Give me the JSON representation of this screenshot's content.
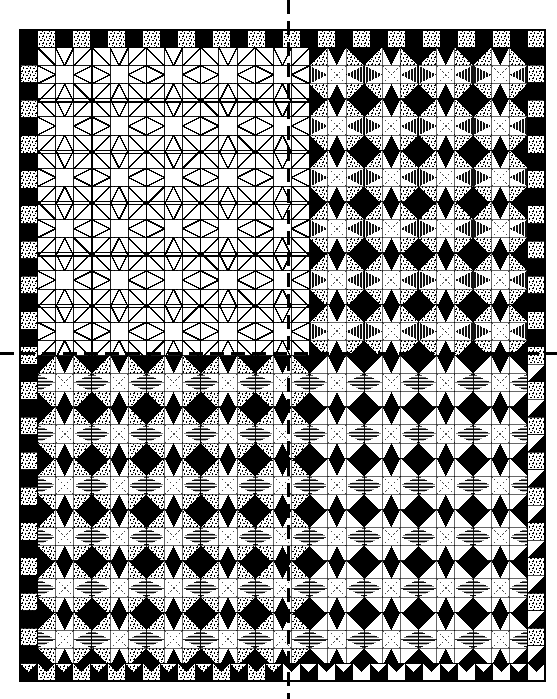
{
  "document": {
    "type": "quilt-pattern-diagram",
    "title": "Quilt Block Layout Diagram",
    "description": "Four-quadrant quilt design chart. Upper-left quadrant is an un-shaded line drawing of the pieced blocks; the other three quadrants show the same blocks filled with three fabric values (dark solid, dotted light, and line-shaded medium). Dashed center lines mark the vertical and horizontal axes of symmetry."
  },
  "canvas": {
    "width": 557,
    "height": 699,
    "background": "#ffffff"
  },
  "quilt": {
    "left": 20,
    "top": 30,
    "right": 545,
    "bottom": 681,
    "outline_color": "#000000",
    "outline_width": 2,
    "border_band_cells": 1,
    "cell_size": 17.5,
    "grid_cols": 30,
    "grid_rows": 37,
    "block_cells": 3,
    "block_cols": 10,
    "block_rows": 12
  },
  "center_lines": {
    "vertical_x": 288,
    "horizontal_y": 353,
    "style": "dashed",
    "color": "#000000",
    "width": 3,
    "dash": "14 7"
  },
  "fabrics": [
    {
      "key": "white",
      "label": "Background / white",
      "color": "#ffffff",
      "fill_type": "solid"
    },
    {
      "key": "dark",
      "label": "Dark solid fabric",
      "color": "#000000",
      "fill_type": "solid"
    },
    {
      "key": "dotted",
      "label": "Light dotted print fabric",
      "color": "#ffffff",
      "fill_type": "stipple"
    },
    {
      "key": "shaded",
      "label": "Medium line-shaded fabric",
      "color": "#ffffff",
      "fill_type": "hatch"
    },
    {
      "key": "outline",
      "label": "Piecing seam line",
      "color": "#000000",
      "fill_type": "line"
    }
  ],
  "quadrants": [
    {
      "key": "top-left",
      "name": "Unshaded line-drawing quadrant",
      "render_mode": "outline",
      "x": 20,
      "y": 30,
      "w": 268,
      "h": 323,
      "note": "Seam lines only, no fabric values"
    },
    {
      "key": "top-right",
      "name": "Shaded quadrant — star variant A",
      "render_mode": "filled",
      "x": 288,
      "y": 30,
      "w": 257,
      "h": 323,
      "note": "Blocks filled with dark, dotted and line-shaded fabrics"
    },
    {
      "key": "bottom-left",
      "name": "Shaded quadrant — star variant B",
      "render_mode": "filled",
      "x": 20,
      "y": 353,
      "w": 268,
      "h": 328,
      "note": "Heavier dark value placement, horizontal line shading"
    },
    {
      "key": "bottom-right",
      "name": "Shaded quadrant — star variant C",
      "render_mode": "filled",
      "x": 288,
      "y": 353,
      "w": 257,
      "h": 328,
      "note": "Dark outer border with sawtooth edge triangles"
    }
  ],
  "border": {
    "name": "Pieced checkerboard border",
    "pattern": "alternating dark squares and dotted squares with sawtooth triangles",
    "width_cells": 1
  }
}
